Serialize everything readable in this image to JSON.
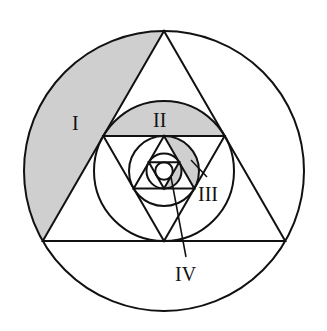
{
  "diagram": {
    "center": [
      164,
      171
    ],
    "outer_radius": 140,
    "colors": {
      "stroke": "#111111",
      "shade": "#cfcfcf",
      "background": "#ffffff"
    },
    "labels": {
      "region_1": "I",
      "region_2": "II",
      "region_3": "III",
      "region_4": "IV"
    }
  }
}
